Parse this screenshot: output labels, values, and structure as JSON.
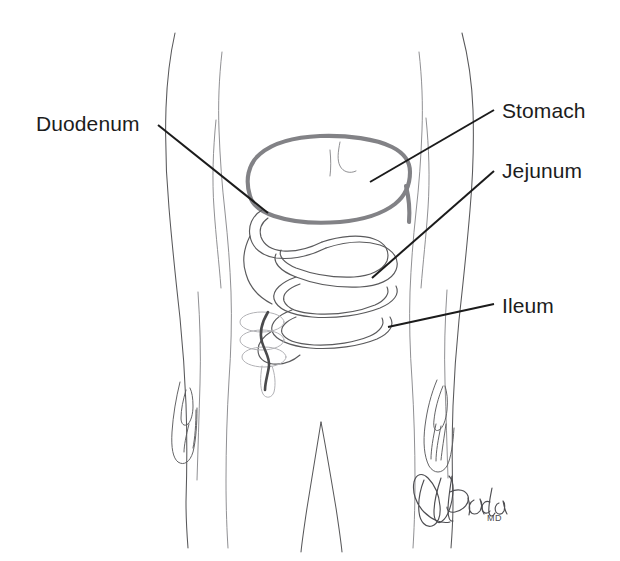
{
  "figure": {
    "background_color": "#ffffff",
    "width": 620,
    "height": 561
  },
  "palette": {
    "text": "#1c1c1c",
    "leader_line": "#1b1b1b",
    "body_outline": "#58585a",
    "body_outline_faint": "#7c7c80",
    "stomach": "#828286",
    "intestine": "#5a5a5c",
    "colon_faint": "#b2b2b6",
    "colon_dark": "#4a4a4c",
    "signature": "#4e4e52"
  },
  "labels": [
    {
      "id": "duodenum",
      "text": "Duodenum",
      "side": "left",
      "leader": {
        "x1": 158,
        "y1": 125,
        "x2": 268,
        "y2": 213
      }
    },
    {
      "id": "stomach",
      "text": "Stomach",
      "side": "right",
      "leader": {
        "x1": 494,
        "y1": 110,
        "x2": 370,
        "y2": 182
      }
    },
    {
      "id": "jejunum",
      "text": "Jejunum",
      "side": "right",
      "leader": {
        "x1": 494,
        "y1": 171,
        "x2": 372,
        "y2": 278
      }
    },
    {
      "id": "ileum",
      "text": "Ileum",
      "side": "right",
      "leader": {
        "x1": 494,
        "y1": 304,
        "x2": 388,
        "y2": 327
      }
    }
  ],
  "signature": {
    "name": "Brada",
    "credential": "MD"
  }
}
